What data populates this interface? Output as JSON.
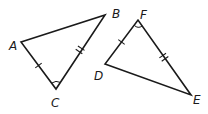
{
  "figure": {
    "triangles": [
      {
        "name": "ABC",
        "vertices": {
          "A": {
            "label": "A",
            "x": 21,
            "y": 42,
            "lx": 9,
            "ly": 50
          },
          "B": {
            "label": "B",
            "x": 105,
            "y": 15,
            "lx": 112,
            "ly": 18
          },
          "C": {
            "label": "C",
            "x": 56,
            "y": 89,
            "lx": 51,
            "ly": 107
          }
        },
        "marks": {
          "AC": "single-tick",
          "BC": "double-tick",
          "angle_C": "arc"
        }
      },
      {
        "name": "DEF",
        "vertices": {
          "D": {
            "label": "D",
            "x": 105,
            "y": 64,
            "lx": 94,
            "ly": 80
          },
          "E": {
            "label": "E",
            "x": 191,
            "y": 95,
            "lx": 193,
            "ly": 104
          },
          "F": {
            "label": "F",
            "x": 138,
            "y": 20,
            "lx": 140,
            "ly": 19
          }
        },
        "marks": {
          "DF": "single-tick",
          "EF": "double-tick",
          "angle_F": "arc"
        }
      }
    ],
    "labels": {
      "A": "A",
      "B": "B",
      "C": "C",
      "D": "D",
      "E": "E",
      "F": "F"
    },
    "colors": {
      "stroke": "#1a1a1a",
      "background": "#ffffff"
    }
  }
}
